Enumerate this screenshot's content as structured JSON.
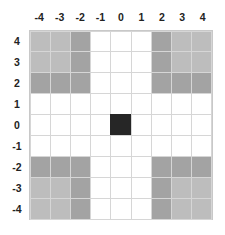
{
  "diagram": {
    "col_labels": [
      "-4",
      "-3",
      "-2",
      "-1",
      "0",
      "1",
      "2",
      "3",
      "4"
    ],
    "row_labels": [
      "4",
      "3",
      "2",
      "1",
      "0",
      "-1",
      "-2",
      "-3",
      "-4"
    ],
    "colors": {
      "white": "#ffffff",
      "light": "#bdbdbd",
      "dark": "#a3a3a3",
      "center": "#262626"
    },
    "cells": [
      [
        "light",
        "light",
        "dark",
        "white",
        "white",
        "white",
        "dark",
        "light",
        "light"
      ],
      [
        "light",
        "light",
        "dark",
        "white",
        "white",
        "white",
        "dark",
        "light",
        "light"
      ],
      [
        "dark",
        "dark",
        "dark",
        "white",
        "white",
        "white",
        "dark",
        "dark",
        "dark"
      ],
      [
        "white",
        "white",
        "white",
        "white",
        "white",
        "white",
        "white",
        "white",
        "white"
      ],
      [
        "white",
        "white",
        "white",
        "white",
        "center",
        "white",
        "white",
        "white",
        "white"
      ],
      [
        "white",
        "white",
        "white",
        "white",
        "white",
        "white",
        "white",
        "white",
        "white"
      ],
      [
        "dark",
        "dark",
        "dark",
        "white",
        "white",
        "white",
        "dark",
        "dark",
        "dark"
      ],
      [
        "light",
        "light",
        "dark",
        "white",
        "white",
        "white",
        "dark",
        "light",
        "light"
      ],
      [
        "light",
        "light",
        "dark",
        "white",
        "white",
        "white",
        "dark",
        "light",
        "light"
      ]
    ]
  }
}
